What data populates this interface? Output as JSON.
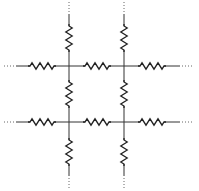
{
  "diagram": {
    "type": "resistor-network",
    "colors": {
      "wire": "#333333",
      "resistor": "#222222",
      "continuation": "#666666",
      "background": "#ffffff"
    },
    "nodes": [
      {
        "id": "n11",
        "x": 69,
        "y": 66
      },
      {
        "id": "n12",
        "x": 124,
        "y": 66
      },
      {
        "id": "n21",
        "x": 69,
        "y": 122
      },
      {
        "id": "n22",
        "x": 124,
        "y": 122
      }
    ],
    "horizontal_resistors": [
      {
        "row_y": 66,
        "cx": 42
      },
      {
        "row_y": 66,
        "cx": 97
      },
      {
        "row_y": 66,
        "cx": 152
      },
      {
        "row_y": 122,
        "cx": 42
      },
      {
        "row_y": 122,
        "cx": 97
      },
      {
        "row_y": 122,
        "cx": 152
      }
    ],
    "vertical_resistors": [
      {
        "col_x": 69,
        "cy": 38
      },
      {
        "col_x": 124,
        "cy": 38
      },
      {
        "col_x": 69,
        "cy": 94
      },
      {
        "col_x": 124,
        "cy": 94
      },
      {
        "col_x": 69,
        "cy": 152
      },
      {
        "col_x": 124,
        "cy": 152
      }
    ],
    "continuation_marks": [
      "top-left",
      "top-right",
      "left-upper",
      "left-lower",
      "right-upper",
      "right-lower",
      "bottom-left",
      "bottom-right"
    ],
    "continuation_symbol": "⋯"
  }
}
